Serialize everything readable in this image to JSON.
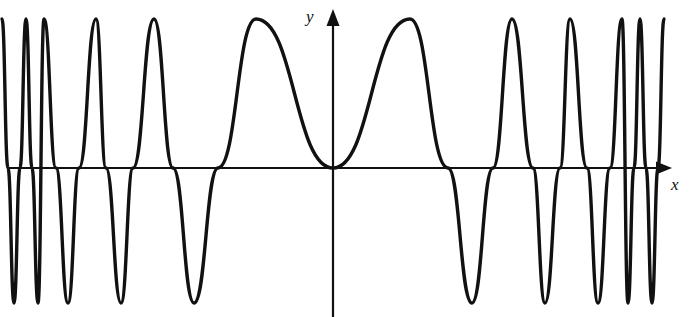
{
  "figure": {
    "background_color": "#ffffff",
    "stroke_color": "#111111",
    "axis_color": "#111111",
    "width": 691,
    "height": 317
  },
  "axes": {
    "y_label": "y",
    "x_label": "x",
    "origin_px": {
      "x": 333,
      "y": 168
    },
    "x_axis_left_px": 8,
    "x_axis_right_px": 666,
    "y_axis_top_px": 10,
    "y_axis_bottom_px": 317,
    "arrowheads": [
      "x-positive",
      "y-positive"
    ]
  },
  "chart_data": {
    "type": "line",
    "title": "",
    "xlabel": "x",
    "ylabel": "y",
    "grid": false,
    "legend": null,
    "symmetry": "even (mirror symmetry about x = 0)",
    "amplitude_constant": true,
    "ylim": [
      -1.08,
      1.08
    ],
    "xlim_px": [
      8,
      666
    ],
    "peak_y_px": 19,
    "trough_y_px": 303,
    "zero_crossings_px": [
      58,
      82,
      108,
      137,
      177,
      222,
      333,
      448,
      493,
      533,
      560,
      587,
      610
    ],
    "maxima_px": [
      {
        "x": 46,
        "y": 19
      },
      {
        "x": 97,
        "y": 19
      },
      {
        "x": 157,
        "y": 19
      },
      {
        "x": 258,
        "y": 19
      },
      {
        "x": 410,
        "y": 19
      },
      {
        "x": 512,
        "y": 19
      },
      {
        "x": 570,
        "y": 19
      },
      {
        "x": 622,
        "y": 19
      }
    ],
    "minima_px": [
      {
        "x": 73,
        "y": 303
      },
      {
        "x": 126,
        "y": 303
      },
      {
        "x": 197,
        "y": 303
      },
      {
        "x": 472,
        "y": 303
      },
      {
        "x": 545,
        "y": 303
      },
      {
        "x": 598,
        "y": 303
      }
    ]
  }
}
